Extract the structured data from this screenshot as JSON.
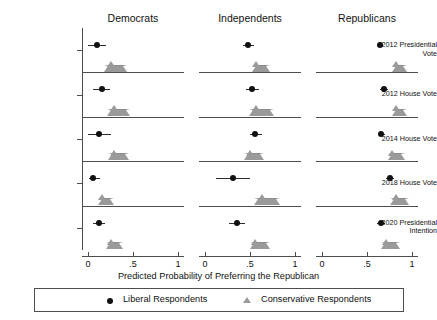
{
  "chart_data": {
    "type": "scatter",
    "title": "",
    "xlabel": "Predicted Probability of Preferring the Republican",
    "ylabel": "",
    "xlim": [
      0,
      1
    ],
    "xticks": [
      0,
      0.5,
      1
    ],
    "xticklabels": [
      "0",
      ".5",
      "1"
    ],
    "grid": false,
    "legend_position": "bottom",
    "panels": [
      "Democrats",
      "Independents",
      "Republicans"
    ],
    "rows": [
      "2012 Presidential\nVote",
      "2012 House Vote",
      "2014 House Vote",
      "2018 House Vote",
      "2020 Presidential\nIntention"
    ],
    "series": [
      {
        "name": "Liberal Respondents",
        "marker": "circle",
        "color": "#111111",
        "points": [
          {
            "panel": "Democrats",
            "row": "2012 Presidential Vote",
            "value": 0.1,
            "low": -0.01,
            "high": 0.2
          },
          {
            "panel": "Democrats",
            "row": "2012 House Vote",
            "value": 0.15,
            "low": 0.06,
            "high": 0.25
          },
          {
            "panel": "Democrats",
            "row": "2014 House Vote",
            "value": 0.12,
            "low": -0.01,
            "high": 0.25
          },
          {
            "panel": "Democrats",
            "row": "2018 House Vote",
            "value": 0.06,
            "low": 0.01,
            "high": 0.13
          },
          {
            "panel": "Democrats",
            "row": "2020 Presidential Intention",
            "value": 0.12,
            "low": 0.05,
            "high": 0.19
          },
          {
            "panel": "Independents",
            "row": "2012 Presidential Vote",
            "value": 0.48,
            "low": 0.42,
            "high": 0.55
          },
          {
            "panel": "Independents",
            "row": "2012 House Vote",
            "value": 0.52,
            "low": 0.46,
            "high": 0.6
          },
          {
            "panel": "Independents",
            "row": "2014 House Vote",
            "value": 0.56,
            "low": 0.5,
            "high": 0.63
          },
          {
            "panel": "Independents",
            "row": "2018 House Vote",
            "value": 0.31,
            "low": 0.12,
            "high": 0.5
          },
          {
            "panel": "Independents",
            "row": "2020 Presidential Intention",
            "value": 0.35,
            "low": 0.27,
            "high": 0.44
          },
          {
            "panel": "Republicans",
            "row": "2012 Presidential Vote",
            "value": 0.64,
            "low": 0.61,
            "high": 0.68
          },
          {
            "panel": "Republicans",
            "row": "2012 House Vote",
            "value": 0.69,
            "low": 0.64,
            "high": 0.73
          },
          {
            "panel": "Republicans",
            "row": "2014 House Vote",
            "value": 0.66,
            "low": 0.63,
            "high": 0.7
          },
          {
            "panel": "Republicans",
            "row": "2018 House Vote",
            "value": 0.75,
            "low": 0.71,
            "high": 0.8
          },
          {
            "panel": "Republicans",
            "row": "2020 Presidential Intention",
            "value": 0.65,
            "low": 0.61,
            "high": 0.7
          }
        ]
      },
      {
        "name": "Conservative Respondents",
        "marker": "triangle",
        "color": "#9a9a9a",
        "points": [
          {
            "panel": "Democrats",
            "row": "2012 Presidential Vote",
            "value": 0.26,
            "low": 0.18,
            "high": 0.34
          },
          {
            "panel": "Democrats",
            "row": "2012 House Vote",
            "value": 0.29,
            "low": 0.21,
            "high": 0.38
          },
          {
            "panel": "Democrats",
            "row": "2014 House Vote",
            "value": 0.29,
            "low": 0.22,
            "high": 0.37
          },
          {
            "panel": "Democrats",
            "row": "2018 House Vote",
            "value": 0.15,
            "low": 0.11,
            "high": 0.2
          },
          {
            "panel": "Democrats",
            "row": "2020 Presidential Intention",
            "value": 0.25,
            "low": 0.2,
            "high": 0.3
          },
          {
            "panel": "Independents",
            "row": "2012 Presidential Vote",
            "value": 0.57,
            "low": 0.52,
            "high": 0.63
          },
          {
            "panel": "Independents",
            "row": "2012 House Vote",
            "value": 0.57,
            "low": 0.49,
            "high": 0.68
          },
          {
            "panel": "Independents",
            "row": "2014 House Vote",
            "value": 0.5,
            "low": 0.43,
            "high": 0.57
          },
          {
            "panel": "Independents",
            "row": "2018 House Vote",
            "value": 0.63,
            "low": 0.54,
            "high": 0.74
          },
          {
            "panel": "Independents",
            "row": "2020 Presidential Intention",
            "value": 0.56,
            "low": 0.5,
            "high": 0.63
          },
          {
            "panel": "Republicans",
            "row": "2012 Presidential Vote",
            "value": 0.82,
            "low": 0.78,
            "high": 0.86
          },
          {
            "panel": "Republicans",
            "row": "2012 House Vote",
            "value": 0.82,
            "low": 0.78,
            "high": 0.86
          },
          {
            "panel": "Republicans",
            "row": "2014 House Vote",
            "value": 0.78,
            "low": 0.73,
            "high": 0.83
          },
          {
            "panel": "Republicans",
            "row": "2018 House Vote",
            "value": 0.82,
            "low": 0.76,
            "high": 0.88
          },
          {
            "panel": "Republicans",
            "row": "2020 Presidential Intention",
            "value": 0.71,
            "low": 0.65,
            "high": 0.78
          }
        ]
      }
    ]
  },
  "panel_titles": {
    "democrats": "Democrats",
    "independents": "Independents",
    "republicans": "Republicans"
  },
  "row_labels": {
    "r0": "2012 Presidential\nVote",
    "r1": "2012 House Vote",
    "r2": "2014 House Vote",
    "r3": "2018 House Vote",
    "r4": "2020 Presidential\nIntention"
  },
  "axis": {
    "xlabel": "Predicted Probability of Preferring the Republican",
    "tick0": "0",
    "tick1": ".5",
    "tick2": "1"
  },
  "legend": {
    "liberal": "Liberal Respondents",
    "conservative": "Conservative Respondents"
  },
  "colors": {
    "liberal_marker": "#111111",
    "conservative_marker": "#9a9a9a",
    "axis_line": "#4d4d4d",
    "background": "#ffffff"
  }
}
